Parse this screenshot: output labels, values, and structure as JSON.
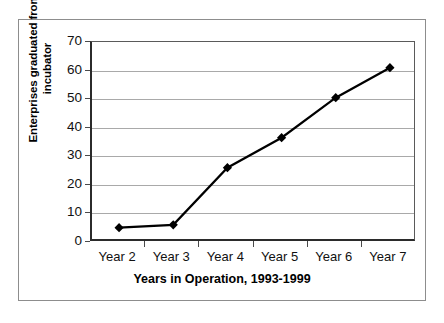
{
  "chart_data": {
    "type": "line",
    "title": "",
    "xlabel": "Years in Operation, 1993-1999",
    "ylabel": "Enterprises graduated from incubator",
    "categories": [
      "Year 2",
      "Year 3",
      "Year 4",
      "Year 5",
      "Year 6",
      "Year 7"
    ],
    "values": [
      5,
      6,
      26,
      36.5,
      50.5,
      61
    ],
    "series": [
      {
        "name": "Enterprises graduated from incubator",
        "values": [
          5,
          6,
          26,
          36.5,
          50.5,
          61
        ]
      }
    ],
    "ylim": [
      0,
      70
    ],
    "yticks": [
      0,
      10,
      20,
      30,
      40,
      50,
      60,
      70
    ],
    "ytick_labels": [
      "0",
      "10",
      "20",
      "30",
      "40",
      "50",
      "60",
      "70"
    ],
    "grid": "horizontal",
    "legend": "none",
    "marker": "diamond",
    "line_color": "#000000",
    "marker_color": "#000000",
    "gridline_color": "#a9a9a9",
    "axis_color": "#2b2b2b",
    "background_color": "#ffffff"
  },
  "ylabel_lines": {
    "line1": "Enterprises graduated from",
    "line2": "incubator"
  }
}
